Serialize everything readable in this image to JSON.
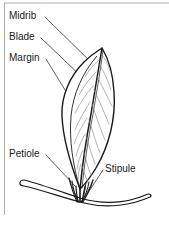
{
  "figure": {
    "background_color": "#ffffff",
    "ink_color": "#1a1a1a",
    "vein_color": "#6b6b6b",
    "labels": [
      {
        "id": "midrib",
        "text": "Midrib"
      },
      {
        "id": "blade",
        "text": "Blade"
      },
      {
        "id": "margin",
        "text": "Margin"
      },
      {
        "id": "petiole",
        "text": "Petiole"
      },
      {
        "id": "stipule",
        "text": "Stipule"
      }
    ],
    "parts": [
      {
        "id": "leaf-blade",
        "name": "leaf blade"
      },
      {
        "id": "midrib-line",
        "name": "midrib"
      },
      {
        "id": "lateral-veins",
        "name": "lateral veins"
      },
      {
        "id": "petiole-line",
        "name": "petiole"
      },
      {
        "id": "stipules",
        "name": "stipules"
      },
      {
        "id": "stem",
        "name": "stem"
      }
    ],
    "frame": {
      "left_rule": true,
      "top_rule": true
    }
  }
}
